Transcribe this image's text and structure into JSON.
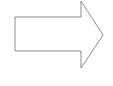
{
  "diagram": {
    "shape": "right-arrow",
    "stroke_color": "#8a8a8a",
    "fill_color": "#ffffff",
    "background": "#ffffff"
  }
}
